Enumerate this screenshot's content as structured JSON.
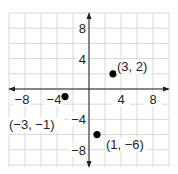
{
  "chart_data": {
    "type": "scatter",
    "title": "",
    "xlabel": "",
    "ylabel": "",
    "xlim": [
      -10,
      10
    ],
    "ylim": [
      -10,
      10
    ],
    "grid": true,
    "grid_step": 2,
    "x_ticks": [
      {
        "value": -8,
        "label": "−8"
      },
      {
        "value": -4,
        "label": "−4"
      },
      {
        "value": 4,
        "label": "4"
      },
      {
        "value": 8,
        "label": "8"
      }
    ],
    "y_ticks": [
      {
        "value": 8,
        "label": "8"
      },
      {
        "value": 4,
        "label": "4"
      },
      {
        "value": -4,
        "label": "−4"
      },
      {
        "value": -8,
        "label": "−8"
      }
    ],
    "points": [
      {
        "x": 3,
        "y": 2,
        "label": "(3, 2)"
      },
      {
        "x": -3,
        "y": -1,
        "label": "(−3, −1)"
      },
      {
        "x": 1,
        "y": -6,
        "label": "(1, −6)"
      }
    ]
  },
  "colors": {
    "grid": "#d9d9d9",
    "axis": "#231f20",
    "point": "#000000",
    "text": "#231f20",
    "background": "#ffffff"
  }
}
